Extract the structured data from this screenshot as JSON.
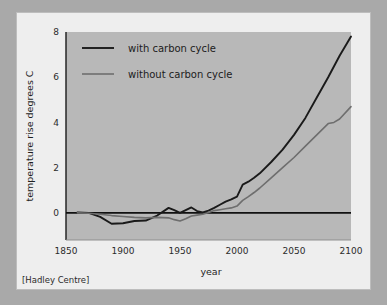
{
  "figure": {
    "source_note": "[Hadley Centre]",
    "background_color": "#a9a9a9",
    "card_color": "#eeeeee",
    "plot_color": "#b8b8b8"
  },
  "chart_data": {
    "type": "line",
    "title": "",
    "xlabel": "year",
    "ylabel": "temperature rise degrees C",
    "xlim": [
      1850,
      2100
    ],
    "ylim": [
      -1.2,
      8
    ],
    "xticks": [
      1850,
      1900,
      1950,
      2000,
      2050,
      2100
    ],
    "xtick_labels": [
      "1850",
      "1900",
      "1950",
      "2000",
      "2050",
      "2100"
    ],
    "yticks": [
      0,
      2,
      4,
      6,
      8
    ],
    "ytick_labels": [
      "0",
      "2",
      "4",
      "6",
      "8"
    ],
    "grid": false,
    "zero_line": 0,
    "legend_position": "upper-left",
    "series": [
      {
        "name": "with carbon cycle",
        "color": "#1a1a1a",
        "x": [
          1860,
          1870,
          1880,
          1890,
          1900,
          1910,
          1920,
          1930,
          1940,
          1945,
          1950,
          1955,
          1960,
          1965,
          1970,
          1975,
          1980,
          1985,
          1990,
          1995,
          2000,
          2005,
          2010,
          2015,
          2020,
          2030,
          2040,
          2050,
          2060,
          2070,
          2080,
          2090,
          2100
        ],
        "y": [
          0.02,
          0.0,
          -0.18,
          -0.48,
          -0.46,
          -0.36,
          -0.34,
          -0.12,
          0.22,
          0.12,
          0.0,
          0.12,
          0.24,
          0.08,
          0.02,
          0.1,
          0.22,
          0.36,
          0.5,
          0.6,
          0.72,
          1.25,
          1.38,
          1.55,
          1.75,
          2.25,
          2.8,
          3.45,
          4.2,
          5.1,
          6.0,
          6.95,
          7.8
        ]
      },
      {
        "name": "without carbon cycle",
        "color": "#6e6e6e",
        "x": [
          1860,
          1870,
          1880,
          1890,
          1900,
          1910,
          1920,
          1930,
          1940,
          1945,
          1950,
          1955,
          1960,
          1965,
          1970,
          1975,
          1980,
          1985,
          1990,
          1995,
          2000,
          2005,
          2010,
          2015,
          2020,
          2030,
          2040,
          2050,
          2060,
          2070,
          2080,
          2085,
          2090,
          2100
        ],
        "y": [
          0.0,
          -0.02,
          -0.06,
          -0.12,
          -0.16,
          -0.2,
          -0.22,
          -0.2,
          -0.22,
          -0.3,
          -0.36,
          -0.26,
          -0.14,
          -0.1,
          -0.06,
          0.02,
          0.1,
          0.14,
          0.18,
          0.22,
          0.3,
          0.55,
          0.72,
          0.9,
          1.1,
          1.55,
          2.0,
          2.45,
          2.95,
          3.45,
          3.95,
          4.0,
          4.15,
          4.7
        ]
      }
    ]
  },
  "legend": {
    "entries": [
      {
        "label": "with carbon cycle",
        "color": "#1a1a1a"
      },
      {
        "label": "without carbon cycle",
        "color": "#6e6e6e"
      }
    ]
  }
}
